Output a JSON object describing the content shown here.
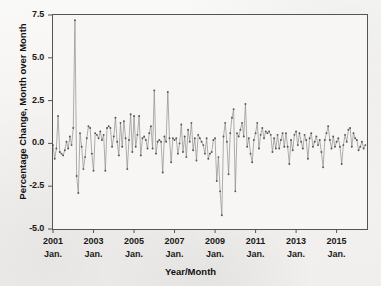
{
  "chart_data": {
    "type": "line",
    "title": "",
    "xlabel": "Year/Month",
    "ylabel": "Percentage Change, Month over Month",
    "grid": false,
    "legend": false,
    "ylim": [
      -5.0,
      7.5
    ],
    "ytick_labels": [
      "7.5",
      "5.0",
      "2.5",
      "0.0",
      "-2.5",
      "-5.0"
    ],
    "ytick_values": [
      7.5,
      5.0,
      2.5,
      0.0,
      -2.5,
      -5.0
    ],
    "xtick_labels": [
      "2001",
      "2003",
      "2005",
      "2007",
      "2009",
      "2011",
      "2013",
      "2015"
    ],
    "xtick_sublabels": [
      "Jan.",
      "Jan.",
      "Jan.",
      "Jan.",
      "Jan.",
      "Jan.",
      "Jan.",
      "Jan."
    ],
    "xtick_values": [
      0,
      24,
      48,
      72,
      96,
      120,
      144,
      168
    ],
    "xlim": [
      0,
      186
    ],
    "series_name": "Monthly percentage change",
    "line_color": "#8c8c8c",
    "marker_color": "#555555",
    "x_start_label": "2001 Jan.",
    "x_end_label": "2016 Jun.",
    "n_points": 186,
    "values": [
      -0.1,
      -0.9,
      -0.3,
      1.6,
      -0.5,
      -0.6,
      -0.7,
      -0.4,
      0.1,
      -0.3,
      0.4,
      -0.1,
      0.9,
      7.2,
      -1.9,
      -2.9,
      0.6,
      -0.2,
      -1.5,
      -0.8,
      0.3,
      1.0,
      0.9,
      -0.6,
      -1.6,
      0.6,
      0.5,
      0.3,
      0.7,
      0.2,
      0.5,
      -1.6,
      0.9,
      1.0,
      0.9,
      -0.2,
      0.4,
      1.5,
      0.1,
      -0.7,
      1.2,
      -0.2,
      1.3,
      0.3,
      -1.5,
      0.2,
      1.7,
      -0.5,
      1.6,
      -0.2,
      0.5,
      1.6,
      -0.7,
      0.3,
      0.4,
      0.2,
      -0.3,
      0.6,
      1.0,
      -0.3,
      3.1,
      -0.6,
      0.1,
      0.2,
      0.1,
      -1.7,
      0.4,
      0.1,
      3.0,
      0.3,
      -1.1,
      0.3,
      0.2,
      0.3,
      -0.6,
      0.0,
      1.1,
      -0.5,
      0.4,
      -0.8,
      0.8,
      0.1,
      1.2,
      -0.4,
      0.3,
      -1.0,
      0.5,
      0.3,
      0.1,
      -0.1,
      -0.6,
      0.3,
      -0.9,
      -0.6,
      -0.5,
      0.2,
      0.3,
      -2.2,
      -0.8,
      -2.8,
      -4.2,
      0.4,
      1.2,
      0.1,
      -1.8,
      0.6,
      1.5,
      2.0,
      -2.8,
      0.6,
      0.4,
      0.8,
      1.2,
      0.4,
      2.3,
      -0.2,
      0.3,
      -0.6,
      -1.1,
      0.2,
      0.6,
      1.2,
      -0.3,
      0.5,
      0.9,
      0.3,
      0.7,
      0.6,
      0.7,
      0.5,
      -0.5,
      0.3,
      -0.3,
      0.5,
      -0.3,
      0.2,
      0.6,
      -0.2,
      0.6,
      -0.2,
      -1.2,
      0.2,
      -0.4,
      0.5,
      0.7,
      -0.1,
      0.6,
      0.1,
      -0.3,
      0.5,
      0.2,
      -0.9,
      0.3,
      0.6,
      -0.2,
      0.1,
      0.4,
      -0.1,
      0.2,
      -0.5,
      -1.4,
      0.2,
      0.6,
      1.0,
      0.2,
      -0.3,
      0.4,
      -0.2,
      0.1,
      0.3,
      -0.2,
      -1.2,
      -0.1,
      0.5,
      0.1,
      0.8,
      0.9,
      -0.2,
      0.6,
      0.3,
      0.2,
      -0.4,
      -0.2,
      0.1,
      -0.3,
      -0.1
    ]
  }
}
